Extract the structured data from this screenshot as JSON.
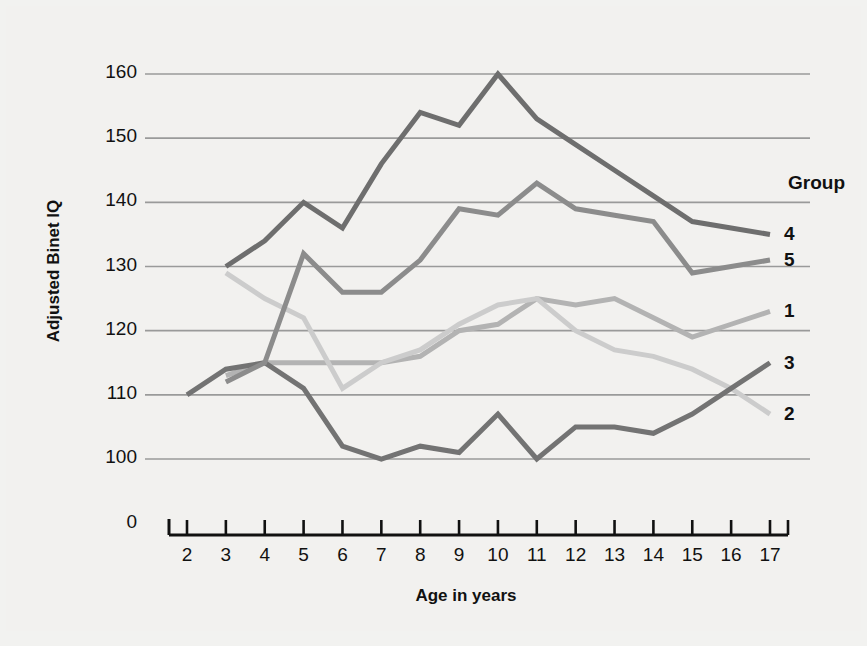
{
  "figure": {
    "background": "#f2f1ef",
    "legend_title": "Group"
  },
  "chart_data": {
    "type": "line",
    "title": "",
    "xlabel": "Age in years",
    "ylabel": "Adjusted Binet IQ",
    "xlim": [
      2,
      17
    ],
    "ylim": [
      100,
      160
    ],
    "grid": true,
    "legend_position": "right",
    "x_ticks": [
      "2",
      "3",
      "4",
      "5",
      "6",
      "7",
      "8",
      "9",
      "10",
      "11",
      "12",
      "13",
      "14",
      "15",
      "16",
      "17"
    ],
    "y_ticks": [
      "160",
      "150",
      "140",
      "130",
      "120",
      "110",
      "100"
    ],
    "y_zero_label": "0",
    "series": [
      {
        "name": "1",
        "color": "#b3b3b3",
        "x": [
          3,
          4,
          5,
          6,
          7,
          8,
          9,
          10,
          11,
          12,
          13,
          14,
          15,
          16,
          17
        ],
        "values": [
          113,
          115,
          115,
          115,
          115,
          116,
          120,
          121,
          125,
          124,
          125,
          122,
          119,
          121,
          123
        ]
      },
      {
        "name": "2",
        "color": "#cccccc",
        "x": [
          3,
          4,
          5,
          6,
          7,
          8,
          9,
          10,
          11,
          12,
          13,
          14,
          15,
          16,
          17
        ],
        "values": [
          129,
          125,
          122,
          111,
          115,
          117,
          121,
          124,
          125,
          120,
          117,
          116,
          114,
          111,
          107
        ]
      },
      {
        "name": "3",
        "color": "#737373",
        "x": [
          2,
          3,
          4,
          5,
          6,
          7,
          8,
          9,
          10,
          11,
          12,
          13,
          14,
          15,
          16,
          17
        ],
        "values": [
          110,
          114,
          115,
          111,
          102,
          100,
          102,
          101,
          107,
          100,
          105,
          105,
          104,
          107,
          111,
          115
        ]
      },
      {
        "name": "4",
        "color": "#6e6e6e",
        "x": [
          3,
          4,
          5,
          6,
          7,
          8,
          9,
          10,
          11,
          12,
          13,
          14,
          15,
          16,
          17
        ],
        "values": [
          130,
          134,
          140,
          136,
          146,
          154,
          152,
          160,
          153,
          149,
          145,
          141,
          137,
          136,
          135
        ]
      },
      {
        "name": "5",
        "color": "#8c8c8c",
        "x": [
          3,
          4,
          5,
          6,
          7,
          8,
          9,
          10,
          11,
          12,
          13,
          14,
          15,
          16,
          17
        ],
        "values": [
          112,
          115,
          132,
          126,
          126,
          131,
          139,
          138,
          143,
          139,
          138,
          137,
          129,
          130,
          131
        ]
      }
    ],
    "legend_order": [
      "4",
      "5",
      "1",
      "3",
      "2"
    ]
  }
}
